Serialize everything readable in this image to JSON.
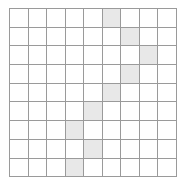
{
  "figure": {
    "name": "grid-pattern",
    "type": "cell-grid",
    "rows": 9,
    "columns": 9,
    "cell_fill_empty": "#ffffff",
    "cell_fill_shaded": "#e8e8e8",
    "grid_line_color": "#9a9a9a",
    "background": "#ffffff"
  },
  "grid": {
    "shaded_cells": [
      {
        "row": 1,
        "column": 6
      },
      {
        "row": 2,
        "column": 7
      },
      {
        "row": 3,
        "column": 8
      },
      {
        "row": 4,
        "column": 7
      },
      {
        "row": 5,
        "column": 6
      },
      {
        "row": 6,
        "column": 5
      },
      {
        "row": 7,
        "column": 4
      },
      {
        "row": 8,
        "column": 5
      },
      {
        "row": 9,
        "column": 4
      }
    ],
    "matrix": [
      [
        0,
        0,
        0,
        0,
        0,
        1,
        0,
        0,
        0
      ],
      [
        0,
        0,
        0,
        0,
        0,
        0,
        1,
        0,
        0
      ],
      [
        0,
        0,
        0,
        0,
        0,
        0,
        0,
        1,
        0
      ],
      [
        0,
        0,
        0,
        0,
        0,
        0,
        1,
        0,
        0
      ],
      [
        0,
        0,
        0,
        0,
        0,
        1,
        0,
        0,
        0
      ],
      [
        0,
        0,
        0,
        0,
        1,
        0,
        0,
        0,
        0
      ],
      [
        0,
        0,
        0,
        1,
        0,
        0,
        0,
        0,
        0
      ],
      [
        0,
        0,
        0,
        0,
        1,
        0,
        0,
        0,
        0
      ],
      [
        0,
        0,
        0,
        1,
        0,
        0,
        0,
        0,
        0
      ]
    ]
  }
}
